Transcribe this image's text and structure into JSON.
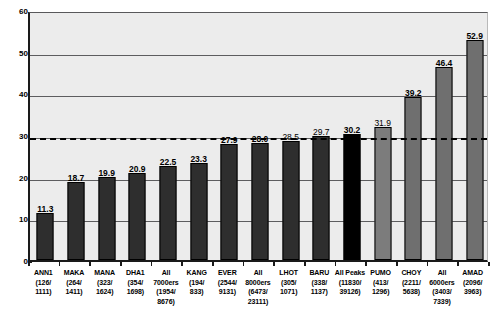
{
  "chart_data": {
    "type": "bar",
    "title": "",
    "subtitle": "",
    "xlabel": "",
    "ylabel": "",
    "ylim": [
      0,
      60
    ],
    "yticks": [
      0,
      10,
      20,
      30,
      40,
      50,
      60
    ],
    "grid": true,
    "legend": "none",
    "annotations": [
      {
        "name": "threshold-line",
        "value": 30,
        "style": "dashed",
        "label": ""
      }
    ],
    "categories": [
      "ANN1 (126/1111)",
      "MAKA (264/1411)",
      "MANA (323/1624)",
      "DHA1 (354/1698)",
      "All 7000ers (1954/8676)",
      "KANG (194/833)",
      "EVER (2544/9131)",
      "All 8000ers (6473/23111)",
      "LHOT (305/1071)",
      "BARU (338/1137)",
      "All Peaks (11830/39126)",
      "PUMO (413/1296)",
      "CHOY (2211/5638)",
      "All 6000ers (3403/7339)",
      "AMAD (2096/3963)"
    ],
    "values": [
      11.3,
      18.7,
      19.9,
      20.9,
      22.5,
      23.3,
      27.9,
      28.0,
      28.5,
      29.7,
      30.2,
      31.9,
      39.2,
      46.4,
      52.9
    ],
    "bars": [
      {
        "label_lines": [
          "ANN1",
          "(126/",
          "1111)"
        ],
        "value": 11.3,
        "value_text": "11.3",
        "value_bold": true,
        "color": "#2e2e2e"
      },
      {
        "label_lines": [
          "MAKA",
          "(264/",
          "1411)"
        ],
        "value": 18.7,
        "value_text": "18.7",
        "value_bold": true,
        "color": "#2e2e2e"
      },
      {
        "label_lines": [
          "MANA",
          "(323/",
          "1624)"
        ],
        "value": 19.9,
        "value_text": "19.9",
        "value_bold": true,
        "color": "#2e2e2e"
      },
      {
        "label_lines": [
          "DHA1",
          "(354/",
          "1698)"
        ],
        "value": 20.9,
        "value_text": "20.9",
        "value_bold": true,
        "color": "#2e2e2e"
      },
      {
        "label_lines": [
          "All",
          "7000ers",
          "(1954/",
          "8676)"
        ],
        "value": 22.5,
        "value_text": "22.5",
        "value_bold": true,
        "color": "#2e2e2e"
      },
      {
        "label_lines": [
          "KANG",
          "(194/",
          "833)"
        ],
        "value": 23.3,
        "value_text": "23.3",
        "value_bold": true,
        "color": "#2e2e2e"
      },
      {
        "label_lines": [
          "EVER",
          "(2544/",
          "9131)"
        ],
        "value": 27.9,
        "value_text": "27.9",
        "value_bold": true,
        "color": "#2e2e2e"
      },
      {
        "label_lines": [
          "All",
          "8000ers",
          "(6473/",
          "23111)"
        ],
        "value": 28.0,
        "value_text": "28.0",
        "value_bold": true,
        "color": "#2e2e2e"
      },
      {
        "label_lines": [
          "LHOT",
          "(305/",
          "1071)"
        ],
        "value": 28.5,
        "value_text": "28.5",
        "value_bold": false,
        "color": "#2e2e2e"
      },
      {
        "label_lines": [
          "BARU",
          "(338/",
          "1137)"
        ],
        "value": 29.7,
        "value_text": "29.7",
        "value_bold": false,
        "color": "#2e2e2e"
      },
      {
        "label_lines": [
          "All  Peaks",
          "(11830/",
          "39126)"
        ],
        "value": 30.2,
        "value_text": "30.2",
        "value_bold": true,
        "color": "#000000"
      },
      {
        "label_lines": [
          "PUMO",
          "(413/",
          "1296)"
        ],
        "value": 31.9,
        "value_text": "31.9",
        "value_bold": false,
        "color": "#7c7c7c"
      },
      {
        "label_lines": [
          "CHOY",
          "(2211/",
          "5638)"
        ],
        "value": 39.2,
        "value_text": "39.2",
        "value_bold": true,
        "color": "#6f6f6f"
      },
      {
        "label_lines": [
          "All",
          "6000ers",
          "(3403/",
          "7339)"
        ],
        "value": 46.4,
        "value_text": "46.4",
        "value_bold": true,
        "color": "#6f6f6f"
      },
      {
        "label_lines": [
          "AMAD",
          "(2096/",
          "3963)"
        ],
        "value": 52.9,
        "value_text": "52.9",
        "value_bold": true,
        "color": "#6f6f6f"
      }
    ]
  },
  "colors": {
    "plot_background": "#ececec",
    "page_background": "#ffffff",
    "bar_dark": "#2e2e2e",
    "bar_black": "#000000",
    "bar_gray": "#6f6f6f",
    "gridline": "#5d5d5f",
    "axis": "#1a1a1a",
    "threshold": "#000000"
  }
}
